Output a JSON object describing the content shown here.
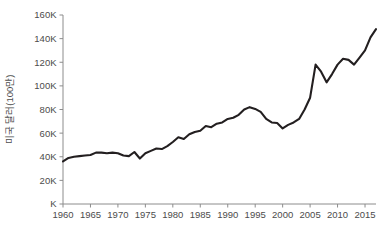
{
  "chart_data": {
    "type": "line",
    "title": "",
    "subtitle": "",
    "xlabel": "",
    "ylabel": "미국 달러(100만)",
    "xlim": [
      1960,
      2017
    ],
    "ylim": [
      0,
      160000
    ],
    "grid": false,
    "legend": null,
    "legend_position": "none",
    "xticks": [
      1960,
      1965,
      1970,
      1975,
      1980,
      1985,
      1990,
      1995,
      2000,
      2005,
      2010,
      2015
    ],
    "xtick_labels": [
      "1960",
      "1965",
      "1970",
      "1975",
      "1980",
      "1985",
      "1990",
      "1995",
      "2000",
      "2005",
      "2010",
      "2015"
    ],
    "yticks": [
      0,
      20000,
      40000,
      60000,
      80000,
      100000,
      120000,
      140000,
      160000
    ],
    "ytick_labels": [
      "K",
      "20K",
      "40K",
      "60K",
      "80K",
      "100K",
      "120K",
      "140K",
      "160K"
    ],
    "series": [
      {
        "name": "미국 달러(100만)",
        "color": "#231f20",
        "x": [
          1960,
          1961,
          1962,
          1963,
          1964,
          1965,
          1966,
          1967,
          1968,
          1969,
          1970,
          1971,
          1972,
          1973,
          1974,
          1975,
          1976,
          1977,
          1978,
          1979,
          1980,
          1981,
          1982,
          1983,
          1984,
          1985,
          1986,
          1987,
          1988,
          1989,
          1990,
          1991,
          1992,
          1993,
          1994,
          1995,
          1996,
          1997,
          1998,
          1999,
          2000,
          2001,
          2002,
          2003,
          2004,
          2005,
          2006,
          2007,
          2008,
          2009,
          2010,
          2011,
          2012,
          2013,
          2014,
          2015,
          2016,
          2017
        ],
        "values": [
          36000,
          39000,
          40000,
          40500,
          41000,
          41500,
          43500,
          43500,
          43000,
          43500,
          43000,
          41000,
          40500,
          44000,
          38500,
          43000,
          45000,
          47000,
          46500,
          49000,
          52500,
          56500,
          55000,
          59000,
          61000,
          62000,
          66000,
          65000,
          68000,
          69000,
          72000,
          73000,
          75500,
          80000,
          82000,
          80500,
          78000,
          72000,
          69000,
          68500,
          64000,
          67000,
          69000,
          72000,
          80000,
          90000,
          118000,
          112000,
          103000,
          110000,
          118000,
          123000,
          122000,
          118000,
          124000,
          130000,
          141000,
          148000
        ]
      }
    ]
  },
  "axes": {
    "ytitle": "미국 달러(100만)"
  }
}
